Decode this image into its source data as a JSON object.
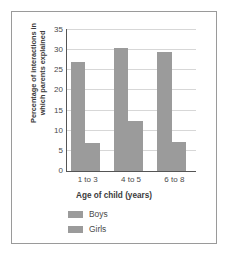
{
  "chart_data": {
    "type": "bar",
    "title": "",
    "subtitle": "",
    "xlabel": "Age of child (years)",
    "ylabel": "Percentage of interactions in which parents explained",
    "ylabel_lines": [
      "Percentage of interactions in",
      "which parents explained"
    ],
    "categories": [
      "1 to 3",
      "4 to 5",
      "6 to 8"
    ],
    "series": [
      {
        "name": "Boys",
        "values": [
          27,
          30.5,
          29.5
        ],
        "color": "#9b9b9b"
      },
      {
        "name": "Girls",
        "values": [
          7,
          12.5,
          7.3
        ],
        "color": "#9b9b9b"
      }
    ],
    "ylim": [
      0,
      35
    ],
    "yticks": [
      0,
      5,
      10,
      15,
      20,
      25,
      30,
      35
    ],
    "ytick_labels": [
      "0",
      "5",
      "10",
      "15",
      "20",
      "25",
      "30",
      "35"
    ],
    "grid": true,
    "grid_axis": "y",
    "legend_position": "bottom-left",
    "legend": [
      "Boys",
      "Girls"
    ],
    "bar_color": "#9b9b9b",
    "axis_color": "#555555",
    "grid_color": "#d7d7d7",
    "frame_color": "#9a9a9a",
    "background": "#ffffff"
  }
}
